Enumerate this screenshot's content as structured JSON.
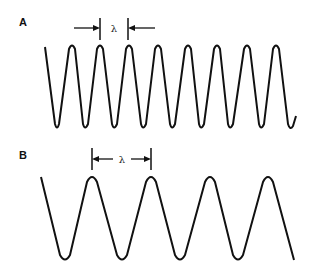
{
  "panels": [
    {
      "label": "A",
      "description": "Short wavelength wave",
      "wavelength_symbol": "λ",
      "stroke_color": "#111111"
    },
    {
      "label": "B",
      "description": "Long wavelength wave",
      "wavelength_symbol": "λ",
      "stroke_color": "#111111"
    }
  ]
}
